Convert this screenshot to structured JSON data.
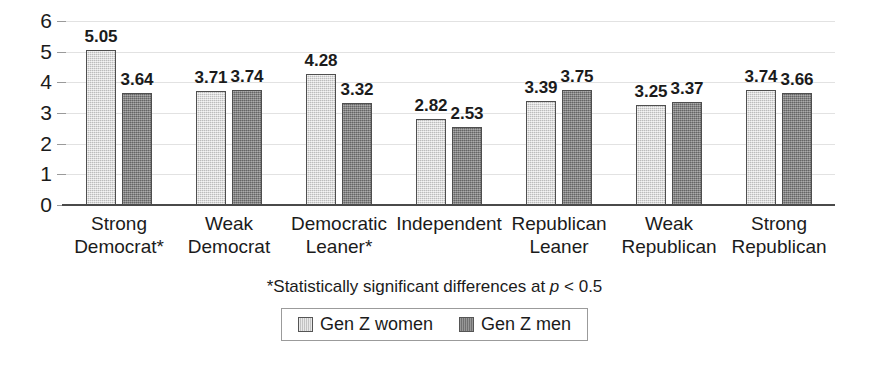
{
  "chart_data": {
    "type": "bar",
    "title": "",
    "subtitle": "",
    "xlabel": "",
    "ylabel": "",
    "ylim": [
      0,
      6
    ],
    "yticks": [
      "0",
      "1",
      "2",
      "3",
      "4",
      "5",
      "6"
    ],
    "grid": true,
    "legend_position": "bottom",
    "categories": [
      "Strong\nDemocrat*",
      "Weak\nDemocrat",
      "Democratic\nLeaner*",
      "Independent",
      "Republican\nLeaner",
      "Weak\nRepublican",
      "Strong\nRepublican"
    ],
    "category_lines": [
      [
        "Strong",
        "Democrat*"
      ],
      [
        "Weak",
        "Democrat"
      ],
      [
        "Democratic",
        "Leaner*"
      ],
      [
        "Independent",
        ""
      ],
      [
        "Republican",
        "Leaner"
      ],
      [
        "Weak",
        "Republican"
      ],
      [
        "Strong",
        "Republican"
      ]
    ],
    "series": [
      {
        "name": "Gen Z women",
        "color": "#d2d2d2",
        "values": [
          5.05,
          3.71,
          4.28,
          2.82,
          3.39,
          3.25,
          3.74
        ],
        "labels": [
          "5.05",
          "3.71",
          "4.28",
          "2.82",
          "3.39",
          "3.25",
          "3.74"
        ]
      },
      {
        "name": "Gen Z men",
        "color": "#7d7d7d",
        "values": [
          3.64,
          3.74,
          3.32,
          2.53,
          3.75,
          3.37,
          3.66
        ],
        "labels": [
          "3.64",
          "3.74",
          "3.32",
          "2.53",
          "3.75",
          "3.37",
          "3.66"
        ]
      }
    ],
    "annotations": [
      "*Statistically significant differences at p < 0.5"
    ]
  },
  "footnote": {
    "prefix": "*Statistically significant differences at ",
    "italic_symbol": "p",
    "suffix": " < 0.5"
  },
  "legend": {
    "entries": [
      {
        "label": "Gen Z women",
        "swatch": "light-gray-swatch"
      },
      {
        "label": "Gen Z men",
        "swatch": "dark-gray-swatch"
      }
    ]
  },
  "colors": {
    "women_bar": "#d2d2d2",
    "men_bar": "#7d7d7d",
    "bar_outline": "#4f4f4f",
    "gridline": "#e2e2e2",
    "axis": "#4a4a4a",
    "text": "#1b1b1b"
  }
}
